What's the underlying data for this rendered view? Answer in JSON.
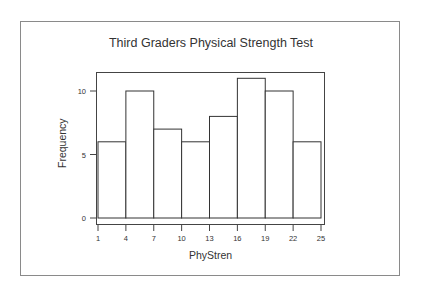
{
  "chart_data": {
    "type": "bar",
    "title": "Third Graders Physical Strength Test",
    "xlabel": "PhyStren",
    "ylabel": "Frequency",
    "bin_edges": [
      1,
      4,
      7,
      10,
      13,
      16,
      19,
      22,
      25
    ],
    "categories": [
      "1-4",
      "4-7",
      "7-10",
      "10-13",
      "13-16",
      "16-19",
      "19-22",
      "22-25"
    ],
    "values": [
      6,
      10,
      7,
      6,
      8,
      11,
      10,
      6
    ],
    "x_ticks": [
      "1",
      "4",
      "7",
      "10",
      "13",
      "16",
      "19",
      "22",
      "25"
    ],
    "y_ticks": [
      "0",
      "5",
      "10"
    ],
    "ylim": [
      0,
      12
    ],
    "grid": false,
    "legend": null,
    "colors": {
      "bar_fill": "#ffffff",
      "bar_edge": "#333333",
      "frame": "#444444"
    }
  }
}
